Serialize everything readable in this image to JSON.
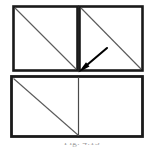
{
  "figure": {
    "background_color": "#ffffff",
    "stroke_color": "#1a1a1a",
    "diagonal_color": "#555555",
    "arrow_color": "#000000",
    "outer_frame_thickness_px": 3,
    "diagonal_thickness_px": 1,
    "quadrants": [
      {
        "name": "top-left",
        "x": 12,
        "y": 5,
        "width": 66,
        "height": 67,
        "has_diagonal": true,
        "diagonal_direction": "top-left-to-bottom-right"
      },
      {
        "name": "top-right",
        "x": 78,
        "y": 5,
        "width": 66,
        "height": 67,
        "has_diagonal": true,
        "diagonal_direction": "top-left-to-bottom-right"
      },
      {
        "name": "bottom-left",
        "x": 10,
        "y": 75,
        "width": 68,
        "height": 63,
        "has_diagonal": true,
        "diagonal_direction": "top-left-to-bottom-right"
      },
      {
        "name": "bottom-right",
        "x": 78,
        "y": 75,
        "width": 66,
        "height": 63,
        "has_diagonal": false,
        "diagonal_direction": "none"
      }
    ],
    "arrow": {
      "name": "pointer-arrow",
      "tail_x": 107,
      "tail_y": 48,
      "head_x": 79,
      "head_y": 72,
      "direction": "down-left",
      "points_at": "center-junction-of-quadrants"
    },
    "caption": {
      "text": "Fig. 4.13",
      "visible": "partially-cropped"
    }
  }
}
